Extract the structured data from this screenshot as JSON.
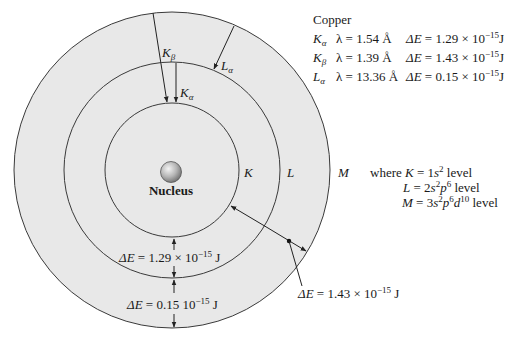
{
  "colors": {
    "shell_fill": "#e8e8e8",
    "line": "#3a3a3a",
    "background": "#ffffff"
  },
  "legend_table": {
    "title": "Copper",
    "rows": [
      {
        "line": "K",
        "sub": "α",
        "lambda": "λ = 1.54 Å",
        "de_symbol": "ΔE",
        "de_value": " = 1.29 × 10",
        "exp": "−15",
        "unit": "J"
      },
      {
        "line": "K",
        "sub": "β",
        "lambda": "λ = 1.39 Å",
        "de_symbol": "ΔE",
        "de_value": " = 1.43 × 10",
        "exp": "−15",
        "unit": "J"
      },
      {
        "line": "L",
        "sub": "α",
        "lambda": "λ = 13.36 Å",
        "de_symbol": "ΔE",
        "de_value": " = 0.15 × 10",
        "exp": "−15",
        "unit": "J"
      }
    ]
  },
  "diagram": {
    "nucleus_label": "Nucleus",
    "shells": [
      {
        "label": "K"
      },
      {
        "label": "L"
      },
      {
        "label": "M"
      }
    ],
    "transition_arrows": [
      {
        "line": "K",
        "sub": "β"
      },
      {
        "line": "K",
        "sub": "α"
      },
      {
        "line": "L",
        "sub": "α"
      }
    ],
    "energy_gaps": [
      {
        "symbol": "ΔE",
        "value": " = 1.29 × 10",
        "exp": "−15",
        "unit": " J"
      },
      {
        "symbol": "ΔE",
        "value": " = 0.15  10",
        "exp": "−15",
        "unit": " J"
      },
      {
        "symbol": "ΔE",
        "value": " = 1.43 × 10",
        "exp": "−15",
        "unit": " J"
      }
    ]
  },
  "shell_definitions": {
    "intro": "where ",
    "rows": [
      {
        "var": "K",
        "eq": " = 1",
        "orbitals": [
          {
            "o": "s",
            "n": "2"
          }
        ],
        "suffix": " level"
      },
      {
        "var": "L",
        "eq": " = 2",
        "orbitals": [
          {
            "o": "s",
            "n": "2"
          },
          {
            "o": "p",
            "n": "6"
          }
        ],
        "suffix": " level"
      },
      {
        "var": "M",
        "eq": " = 3",
        "orbitals": [
          {
            "o": "s",
            "n": "2"
          },
          {
            "o": "p",
            "n": "6"
          },
          {
            "o": "d",
            "n": "10"
          }
        ],
        "suffix": " level"
      }
    ]
  }
}
